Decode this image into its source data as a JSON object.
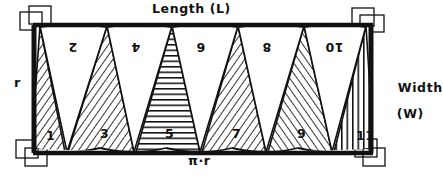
{
  "figure": {
    "labels": {
      "top": "Length (L)",
      "right_line1": "Width",
      "right_line2": "(W)",
      "left": "r",
      "bottom": "π·r"
    },
    "colors": {
      "ink": "#111111",
      "paper": "#ffffff"
    },
    "corner_marks": [
      {
        "name": "top-left",
        "symbol": "right-angle-mark"
      },
      {
        "name": "top-right",
        "symbol": "right-angle-mark"
      },
      {
        "name": "bottom-left",
        "symbol": "right-angle-mark"
      },
      {
        "name": "bottom-right",
        "symbol": "right-angle-mark"
      }
    ],
    "wedges": [
      {
        "number": "1",
        "orientation": "up",
        "hatch": "diagonal-left",
        "x": 46,
        "y": 128
      },
      {
        "number": "2",
        "orientation": "down",
        "hatch": "none",
        "x": 68,
        "y": 40
      },
      {
        "number": "3",
        "orientation": "up",
        "hatch": "diagonal-left",
        "x": 100,
        "y": 126
      },
      {
        "number": "4",
        "orientation": "down",
        "hatch": "none",
        "x": 131,
        "y": 40
      },
      {
        "number": "5",
        "orientation": "up",
        "hatch": "horizontal",
        "x": 165,
        "y": 126
      },
      {
        "number": "6",
        "orientation": "down",
        "hatch": "none",
        "x": 196,
        "y": 40
      },
      {
        "number": "7",
        "orientation": "up",
        "hatch": "diagonal-left",
        "x": 232,
        "y": 126
      },
      {
        "number": "8",
        "orientation": "down",
        "hatch": "none",
        "x": 262,
        "y": 40
      },
      {
        "number": "9",
        "orientation": "up",
        "hatch": "diagonal-right",
        "x": 297,
        "y": 126
      },
      {
        "number": "10",
        "orientation": "down",
        "hatch": "none",
        "x": 325,
        "y": 40
      },
      {
        "number": "11",
        "orientation": "up",
        "hatch": "vertical",
        "x": 356,
        "y": 128
      }
    ]
  }
}
